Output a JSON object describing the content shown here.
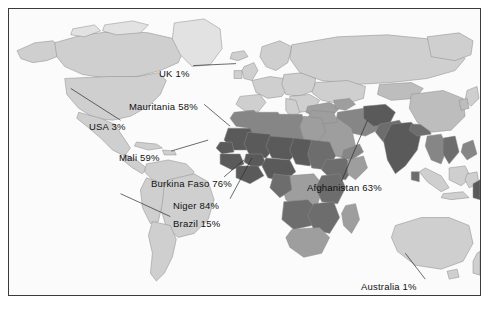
{
  "figure": {
    "type": "world-choropleth-map",
    "background_color": "#ffffff",
    "frame_color": "#3b3b3b",
    "map_background_color": "#fbfbfb"
  },
  "palette": {
    "very_light": "#e2e2e2",
    "light": "#cfcfcf",
    "medium_light": "#bdbdbd",
    "medium": "#9e9e9e",
    "medium_dark": "#868686",
    "dark": "#6d6d6d",
    "very_dark": "#5a5a5a",
    "border": "#8a8a8a",
    "leader_line": "#2b2b2b",
    "label_text": "#111111"
  },
  "labels": [
    {
      "id": "uk",
      "country": "UK",
      "value": "1%",
      "text": "UK 1%",
      "x": 158,
      "y": 66,
      "anchor_x": 236,
      "anchor_y": 64
    },
    {
      "id": "mauritania",
      "country": "Mauritania",
      "value": "58%",
      "text": "Mauritania 58%",
      "x": 128,
      "y": 99,
      "anchor_x": 196,
      "anchor_y": 122
    },
    {
      "id": "usa",
      "country": "USA",
      "value": "3%",
      "text": "USA 3%",
      "x": 88,
      "y": 119,
      "anchor_x": 66,
      "anchor_y": 88
    },
    {
      "id": "mali",
      "country": "Mali",
      "value": "59%",
      "text": "Mali 59%",
      "x": 118,
      "y": 150,
      "anchor_x": 196,
      "anchor_y": 140
    },
    {
      "id": "burkina-faso",
      "country": "Burkina Faso",
      "value": "76%",
      "text": "Burkina Faso 76%",
      "x": 150,
      "y": 176,
      "anchor_x": 222,
      "anchor_y": 158
    },
    {
      "id": "afghanistan",
      "country": "Afghanistan",
      "value": "63%",
      "text": "Afghanistan 63%",
      "x": 306,
      "y": 180,
      "anchor_x": 334,
      "anchor_y": 122
    },
    {
      "id": "niger",
      "country": "Niger",
      "value": "84%",
      "text": "Niger 84%",
      "x": 172,
      "y": 198,
      "anchor_x": 226,
      "anchor_y": 152
    },
    {
      "id": "brazil",
      "country": "Brazil",
      "value": "15%",
      "text": "Brazil 15%",
      "x": 172,
      "y": 216,
      "anchor_x": 116,
      "anchor_y": 194
    },
    {
      "id": "australia",
      "country": "Australia",
      "value": "1%",
      "text": "Australia 1%",
      "x": 360,
      "y": 279,
      "anchor_x": 402,
      "anchor_y": 258
    }
  ],
  "map_data": {
    "highlighted_dark_regions": [
      "West Africa",
      "Sahel",
      "Horn of Africa",
      "South Asia",
      "Afghanistan",
      "Papua New Guinea"
    ],
    "light_regions": [
      "North America",
      "South America",
      "Europe",
      "Russia",
      "Australia",
      "Greenland"
    ]
  }
}
